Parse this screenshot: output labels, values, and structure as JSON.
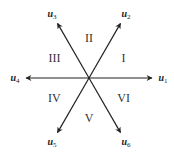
{
  "diagram": {
    "vectors": [
      {
        "id": "u1",
        "base": "u",
        "sub": "1",
        "angle_deg": 0
      },
      {
        "id": "u2",
        "base": "u",
        "sub": "2",
        "angle_deg": 60
      },
      {
        "id": "u3",
        "base": "u",
        "sub": "3",
        "angle_deg": 120
      },
      {
        "id": "u4",
        "base": "u",
        "sub": "4",
        "angle_deg": 180
      },
      {
        "id": "u5",
        "base": "u",
        "sub": "5",
        "angle_deg": 240
      },
      {
        "id": "u6",
        "base": "u",
        "sub": "6",
        "angle_deg": 300
      }
    ],
    "sectors": [
      {
        "label": "I",
        "angle_deg": 30
      },
      {
        "label": "II",
        "angle_deg": 90
      },
      {
        "label": "III",
        "angle_deg": 150
      },
      {
        "label": "IV",
        "angle_deg": 210
      },
      {
        "label": "V",
        "angle_deg": 270
      },
      {
        "label": "VI",
        "angle_deg": 330
      }
    ],
    "colors": {
      "line": "#222222",
      "text": "#333333"
    }
  }
}
